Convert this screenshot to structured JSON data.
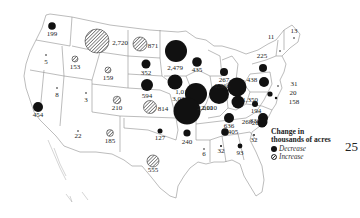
{
  "map": {
    "title": "Change in thousands of acres",
    "units": "thousands of acres",
    "colors": {
      "decrease": "#111111",
      "increase_hatch": "#333333",
      "state_border": "#8a8a8a",
      "background": "#ffffff"
    },
    "markers": [
      {
        "id": "WA",
        "label": "199",
        "type": "decrease",
        "x": 52,
        "y": 26,
        "r": 3.8,
        "lx": 52,
        "ly": 36
      },
      {
        "id": "OR",
        "label": "5",
        "type": "decrease",
        "x": 46,
        "y": 55,
        "r": 0.8,
        "lx": 46,
        "ly": 64
      },
      {
        "id": "ID",
        "label": "153",
        "type": "increase",
        "x": 75,
        "y": 59,
        "r": 3,
        "lx": 75,
        "ly": 69
      },
      {
        "id": "MT",
        "label": "2,720",
        "type": "increase",
        "x": 97,
        "y": 41,
        "r": 12,
        "lx": 120,
        "ly": 45
      },
      {
        "id": "ND",
        "label": "871",
        "type": "increase",
        "x": 140,
        "y": 44,
        "r": 7,
        "lx": 153,
        "ly": 48
      },
      {
        "id": "MN",
        "label": "2,479",
        "type": "decrease",
        "x": 176,
        "y": 51,
        "r": 11,
        "lx": 175,
        "ly": 70
      },
      {
        "id": "WI",
        "label": "435",
        "type": "decrease",
        "x": 197,
        "y": 62,
        "r": 4.8,
        "lx": 197,
        "ly": 72
      },
      {
        "id": "WY",
        "label": "159",
        "type": "increase",
        "x": 108,
        "y": 70,
        "r": 3,
        "lx": 108,
        "ly": 80
      },
      {
        "id": "SD",
        "label": "352",
        "type": "decrease",
        "x": 146,
        "y": 64,
        "r": 4.5,
        "lx": 146,
        "ly": 75
      },
      {
        "id": "NV",
        "label": "8",
        "type": "decrease",
        "x": 57,
        "y": 88,
        "r": 0.8,
        "lx": 57,
        "ly": 97
      },
      {
        "id": "UT",
        "label": "3",
        "type": "decrease",
        "x": 86,
        "y": 93,
        "r": 0.8,
        "lx": 86,
        "ly": 102
      },
      {
        "id": "CO",
        "label": "210",
        "type": "increase",
        "x": 117,
        "y": 100,
        "r": 3.8,
        "lx": 117,
        "ly": 110
      },
      {
        "id": "NE",
        "label": "594",
        "type": "decrease",
        "x": 147,
        "y": 85,
        "r": 6,
        "lx": 147,
        "ly": 98
      },
      {
        "id": "IA",
        "label": "1,017",
        "type": "decrease",
        "x": 175,
        "y": 82,
        "r": 7.5,
        "lx": 183,
        "ly": 94
      },
      {
        "id": "IL",
        "label": "3,031",
        "type": "decrease",
        "x": 196,
        "y": 94,
        "r": 11,
        "lx": 180,
        "ly": 101
      },
      {
        "id": "MI",
        "label": "267",
        "type": "decrease",
        "x": 224,
        "y": 72,
        "r": 4,
        "lx": 224,
        "ly": 82
      },
      {
        "id": "IN",
        "label": "2,010",
        "type": "decrease",
        "x": 219,
        "y": 94,
        "r": 10,
        "lx": 209,
        "ly": 110
      },
      {
        "id": "OH",
        "label": "1,366",
        "type": "decrease",
        "x": 237,
        "y": 87,
        "r": 9.5,
        "lx": 222,
        "ly": 88
      },
      {
        "id": "MO",
        "label": "2,010",
        "type": "decrease",
        "x": 187,
        "y": 111,
        "r": 13.5,
        "lx": 205,
        "ly": 110
      },
      {
        "id": "KS",
        "label": "814",
        "type": "increase",
        "x": 150,
        "y": 107,
        "r": 6.5,
        "lx": 163,
        "ly": 111
      },
      {
        "id": "KY",
        "label": "1,350",
        "type": "decrease",
        "x": 238,
        "y": 102,
        "r": 6.5,
        "lx": 250,
        "ly": 102
      },
      {
        "id": "WV",
        "label": "194",
        "type": "decrease",
        "x": 255,
        "y": 104,
        "r": 3,
        "lx": 256,
        "ly": 113
      },
      {
        "id": "TN",
        "label": "636",
        "type": "decrease",
        "x": 229,
        "y": 118,
        "r": 5,
        "lx": 229,
        "ly": 128
      },
      {
        "id": "VA",
        "label": "336",
        "type": "decrease",
        "x": 263,
        "y": 118,
        "r": 5,
        "lx": 255,
        "ly": 123
      },
      {
        "id": "NC",
        "label": "268",
        "type": "decrease",
        "x": 263,
        "y": 122,
        "r": 4.5,
        "lx": 257,
        "ly": 125
      },
      {
        "id": "CA",
        "label": "454",
        "type": "decrease",
        "x": 38,
        "y": 107,
        "r": 5,
        "lx": 38,
        "ly": 117
      },
      {
        "id": "AZ",
        "label": "22",
        "type": "decrease",
        "x": 78,
        "y": 131,
        "r": 0.8,
        "lx": 78,
        "ly": 138
      },
      {
        "id": "NM",
        "label": "185",
        "type": "increase",
        "x": 110,
        "y": 133,
        "r": 3.4,
        "lx": 110,
        "ly": 143
      },
      {
        "id": "OK",
        "label": "127",
        "type": "decrease",
        "x": 160,
        "y": 131,
        "r": 2.5,
        "lx": 160,
        "ly": 140
      },
      {
        "id": "AR",
        "label": "240",
        "type": "decrease",
        "x": 187,
        "y": 133,
        "r": 3.6,
        "lx": 187,
        "ly": 144
      },
      {
        "id": "LA",
        "label": "6",
        "type": "decrease",
        "x": 204,
        "y": 149,
        "r": 0.8,
        "lx": 204,
        "ly": 156
      },
      {
        "id": "MS",
        "label": "32",
        "type": "decrease",
        "x": 221,
        "y": 146,
        "r": 1,
        "lx": 221,
        "ly": 153
      },
      {
        "id": "AL",
        "label": "405",
        "type": "decrease",
        "x": 225,
        "y": 132,
        "r": 3.8,
        "lx": 233,
        "ly": 134
      },
      {
        "id": "GA",
        "label": "93",
        "type": "decrease",
        "x": 240,
        "y": 146,
        "r": 2.4,
        "lx": 240,
        "ly": 155
      },
      {
        "id": "SC",
        "label": "32",
        "type": "decrease",
        "x": 254,
        "y": 135,
        "r": 0.9,
        "lx": 254,
        "ly": 142
      },
      {
        "id": "SC2",
        "label": "268",
        "type": "decrease",
        "x": 262,
        "y": 123,
        "r": 4.5,
        "lx": 247,
        "ly": 124
      },
      {
        "id": "TX",
        "label": "555",
        "type": "increase",
        "x": 153,
        "y": 161,
        "r": 6,
        "lx": 153,
        "ly": 172
      },
      {
        "id": "NY",
        "label": "225",
        "type": "decrease",
        "x": 263,
        "y": 68,
        "r": 4,
        "lx": 262,
        "ly": 58
      },
      {
        "id": "PA",
        "label": "438",
        "type": "decrease",
        "x": 264,
        "y": 82,
        "r": 5,
        "lx": 252,
        "ly": 82
      },
      {
        "id": "VT",
        "label": "11",
        "type": "decrease",
        "x": 280,
        "y": 51,
        "r": 0.8,
        "lx": 271,
        "ly": 39
      },
      {
        "id": "ME",
        "label": "13",
        "type": "decrease",
        "x": 294,
        "y": 38,
        "r": 0.8,
        "lx": 294,
        "ly": 33
      },
      {
        "id": "NJ",
        "label": "31",
        "type": "decrease",
        "x": 278,
        "y": 86,
        "r": 0.8,
        "lx": 294,
        "ly": 86
      },
      {
        "id": "MD",
        "label": "20",
        "type": "decrease",
        "x": 270,
        "y": 94,
        "r": 2.6,
        "lx": 293,
        "ly": 95
      },
      {
        "id": "DE",
        "label": "158",
        "type": "decrease",
        "x": 276,
        "y": 98,
        "r": 1.2,
        "lx": 294,
        "ly": 104
      }
    ]
  },
  "legend": {
    "title_line1": "Change in",
    "title_line2": "thousands of acres",
    "decrease_label": "Decrease",
    "increase_label": "Increase"
  },
  "page_number": "25"
}
